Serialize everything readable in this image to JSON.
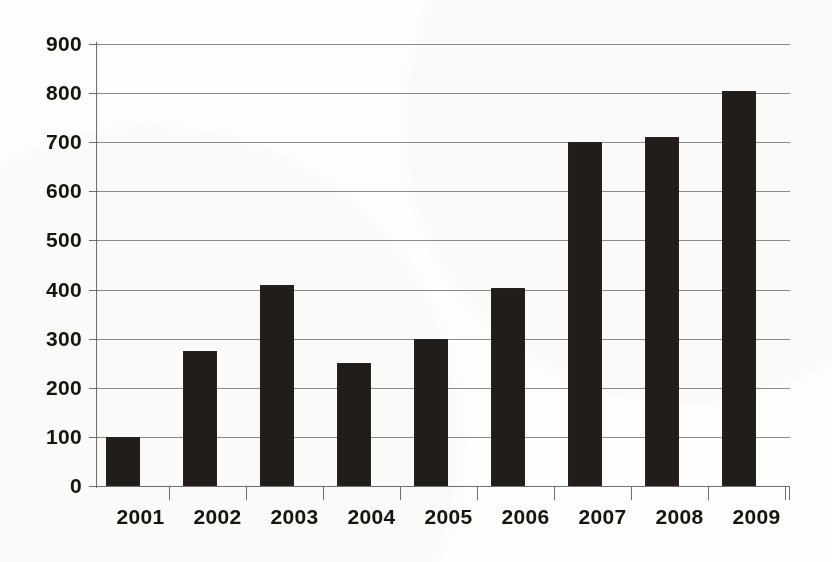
{
  "chart_data": {
    "type": "bar",
    "title": "",
    "subtitle": "",
    "xlabel": "",
    "ylabel": "",
    "categories": [
      "2001",
      "2002",
      "2003",
      "2004",
      "2005",
      "2006",
      "2007",
      "2008",
      "2009"
    ],
    "values": [
      100,
      275,
      410,
      250,
      300,
      403,
      700,
      710,
      805
    ],
    "ylim": [
      0,
      900
    ],
    "ytick_labels": [
      "0",
      "100",
      "200",
      "300",
      "400",
      "500",
      "600",
      "700",
      "800",
      "900"
    ],
    "ytick_values": [
      0,
      100,
      200,
      300,
      400,
      500,
      600,
      700,
      800,
      900
    ],
    "grid": true,
    "grid_axis": "y",
    "legend": false,
    "legend_position": "none",
    "bar_color": "#201d1a",
    "gridline_color": "#8d8d8d",
    "axis_color": "#6f6f6f",
    "background_color": "#fdfdfb",
    "text_color": "#16140f"
  }
}
